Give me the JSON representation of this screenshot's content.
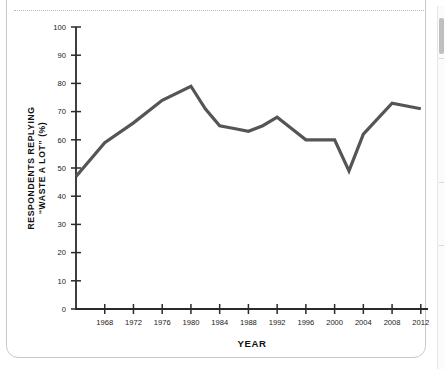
{
  "frame": {
    "card_name": "chart-card",
    "scrollbar_name": "vertical-scrollbar"
  },
  "chart_data": {
    "type": "line",
    "title": "",
    "subtitle": "",
    "xlabel": "YEAR",
    "ylabel_line1": "RESPONDENTS REPLYING",
    "ylabel_line2": "“WASTE A LOT” (%)",
    "ylabel": "RESPONDENTS REPLYING “WASTE A LOT” (%)",
    "xlim": [
      1964,
      2013
    ],
    "ylim": [
      0,
      100
    ],
    "xticks": [
      1968,
      1972,
      1976,
      1980,
      1984,
      1988,
      1992,
      1996,
      2000,
      2004,
      2008,
      2012
    ],
    "xtick_labels": [
      "1968",
      "1972",
      "1976",
      "1980",
      "1984",
      "1988",
      "1992",
      "1996",
      "2000",
      "2004",
      "2008",
      "2012"
    ],
    "yticks": [
      0,
      10,
      20,
      30,
      40,
      50,
      60,
      70,
      80,
      90,
      100
    ],
    "ytick_labels": [
      "0",
      "10",
      "20",
      "30",
      "40",
      "50",
      "60",
      "70",
      "80",
      "90",
      "100"
    ],
    "grid": false,
    "legend": false,
    "legend_position": "none",
    "line_color": "#555555",
    "line_width": 3.2,
    "axis_color": "#2b2b2b",
    "series": [
      {
        "name": "Respondents replying “waste a lot”",
        "x": [
          1964,
          1968,
          1972,
          1976,
          1980,
          1982,
          1984,
          1986,
          1988,
          1990,
          1992,
          1994,
          1996,
          1998,
          2000,
          2002,
          2004,
          2008,
          2012
        ],
        "values": [
          47,
          59,
          66,
          74,
          79,
          71,
          65,
          64,
          63,
          65,
          68,
          64,
          60,
          60,
          60,
          49,
          62,
          73,
          71
        ]
      }
    ]
  }
}
